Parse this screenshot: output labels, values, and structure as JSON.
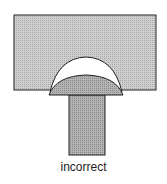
{
  "diagram": {
    "caption": "incorrect",
    "colors": {
      "block_fill": "#c4c4c4",
      "head_fill": "#a6a6a6",
      "stem_fill": "#b0b0b0",
      "void_fill": "#ffffff",
      "stroke": "#222222"
    }
  }
}
